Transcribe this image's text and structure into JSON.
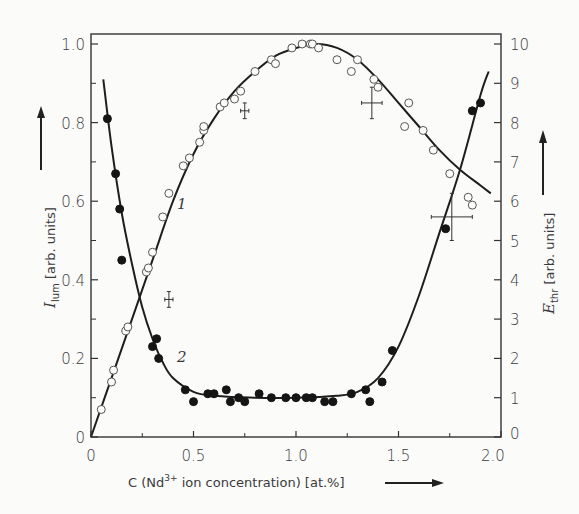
{
  "chart_data": {
    "type": "scatter",
    "title": "",
    "xlabel": "C (Nd3+ ion concentration) [at.%]",
    "xlabel_parts": {
      "prefix": "C (Nd",
      "sup": "3+",
      "suffix": " ion concentration) [at.%]"
    },
    "ylabel_left": "I_lum [arb. units]",
    "ylabel_left_parts": {
      "symbol": "I",
      "sub": "lum",
      "rest": " [arb. units]"
    },
    "ylabel_right": "E_thr [arb. units]",
    "ylabel_right_parts": {
      "symbol": "E",
      "sub": "thr",
      "rest": " [arb. units]"
    },
    "xlim": [
      0,
      2.0
    ],
    "ylim_left": [
      0,
      1.0
    ],
    "ylim_right": [
      0,
      10
    ],
    "x_ticks": [
      "0",
      "0.5",
      "1.0",
      "1.5",
      "2.0"
    ],
    "y_left_ticks": [
      "0",
      "0.2",
      "0.4",
      "0.6",
      "0.8",
      "1.0"
    ],
    "y_right_ticks": [
      "0",
      "1",
      "2",
      "3",
      "4",
      "5",
      "6",
      "7",
      "8",
      "9",
      "10"
    ],
    "grid": false,
    "legend": "none (curves labelled inline)",
    "series": [
      {
        "name": "1",
        "description": "Luminescence intensity I_lum (open circles, left axis)",
        "marker": "open-circle",
        "axis": "left",
        "x": [
          0.05,
          0.1,
          0.11,
          0.17,
          0.18,
          0.27,
          0.28,
          0.3,
          0.35,
          0.38,
          0.45,
          0.48,
          0.53,
          0.55,
          0.55,
          0.63,
          0.65,
          0.7,
          0.73,
          0.8,
          0.88,
          0.9,
          0.98,
          1.03,
          1.07,
          1.08,
          1.11,
          1.2,
          1.27,
          1.3,
          1.38,
          1.4,
          1.53,
          1.55,
          1.62,
          1.67,
          1.75,
          1.84,
          1.86
        ],
        "y": [
          0.07,
          0.14,
          0.17,
          0.27,
          0.28,
          0.42,
          0.43,
          0.47,
          0.56,
          0.62,
          0.69,
          0.71,
          0.75,
          0.78,
          0.79,
          0.84,
          0.85,
          0.86,
          0.88,
          0.93,
          0.96,
          0.95,
          0.99,
          1.0,
          1.0,
          1.0,
          0.99,
          0.96,
          0.93,
          0.96,
          0.91,
          0.89,
          0.79,
          0.85,
          0.78,
          0.73,
          0.67,
          0.61,
          0.59
        ]
      },
      {
        "name": "2",
        "description": "Threshold energy E_thr (filled circles, right axis)",
        "marker": "filled-circle",
        "axis": "right",
        "x": [
          0.08,
          0.12,
          0.14,
          0.15,
          0.3,
          0.32,
          0.33,
          0.46,
          0.5,
          0.57,
          0.6,
          0.66,
          0.68,
          0.72,
          0.75,
          0.82,
          0.88,
          0.95,
          1.0,
          1.05,
          1.08,
          1.14,
          1.18,
          1.27,
          1.34,
          1.36,
          1.42,
          1.47,
          1.73,
          1.86,
          1.9
        ],
        "y": [
          8.1,
          6.7,
          5.8,
          4.5,
          2.3,
          2.5,
          2.0,
          1.2,
          0.9,
          1.1,
          1.1,
          1.2,
          0.9,
          1.0,
          0.9,
          1.1,
          1.0,
          1.0,
          1.0,
          1.0,
          1.0,
          0.9,
          0.9,
          1.1,
          1.2,
          0.9,
          1.4,
          2.2,
          5.3,
          8.3,
          8.5
        ]
      }
    ],
    "fit_curves": [
      {
        "series": "1",
        "axis": "left",
        "x": [
          0.0,
          0.1,
          0.2,
          0.3,
          0.4,
          0.5,
          0.6,
          0.7,
          0.8,
          0.9,
          1.0,
          1.1,
          1.2,
          1.3,
          1.4,
          1.5,
          1.6,
          1.7,
          1.8,
          1.9,
          1.95
        ],
        "y": [
          0.0,
          0.15,
          0.3,
          0.45,
          0.6,
          0.72,
          0.81,
          0.88,
          0.93,
          0.97,
          0.99,
          1.0,
          0.99,
          0.96,
          0.91,
          0.85,
          0.79,
          0.73,
          0.68,
          0.64,
          0.62
        ]
      },
      {
        "series": "2",
        "axis": "right",
        "x": [
          0.06,
          0.1,
          0.15,
          0.2,
          0.25,
          0.3,
          0.35,
          0.4,
          0.5,
          0.6,
          0.8,
          1.0,
          1.2,
          1.3,
          1.4,
          1.5,
          1.6,
          1.7,
          1.8,
          1.9,
          1.94
        ],
        "y": [
          9.1,
          7.4,
          5.7,
          4.4,
          3.3,
          2.5,
          1.9,
          1.5,
          1.15,
          1.05,
          1.0,
          1.0,
          1.05,
          1.15,
          1.5,
          2.3,
          3.6,
          5.2,
          6.8,
          8.7,
          9.3
        ]
      }
    ],
    "error_bars": [
      {
        "axis": "left",
        "x": 0.38,
        "y": 0.35,
        "x_err": 0.02,
        "y_err": 0.02
      },
      {
        "axis": "left",
        "x": 0.75,
        "y": 0.83,
        "x_err": 0.02,
        "y_err": 0.02
      },
      {
        "axis": "left",
        "x": 1.37,
        "y": 0.85,
        "x_err": 0.05,
        "y_err": 0.04
      },
      {
        "axis": "right",
        "x": 1.76,
        "y": 5.6,
        "x_err": 0.1,
        "y_err": 0.6
      }
    ],
    "annotations": [
      {
        "text": "1",
        "x": 0.42,
        "y": 0.58,
        "axis": "left"
      },
      {
        "text": "2",
        "x": 0.42,
        "y": 0.19,
        "axis": "left"
      }
    ]
  }
}
